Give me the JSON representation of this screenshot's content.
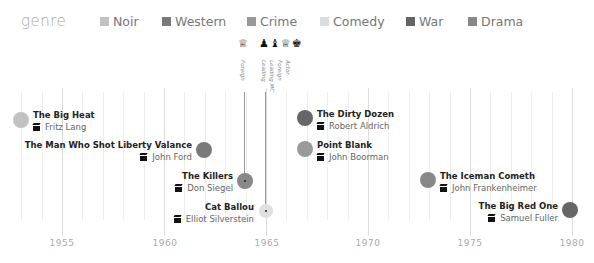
{
  "legend": {
    "title": "genre",
    "items": [
      {
        "label": "Noir",
        "color": "#c2c2c2",
        "x": 100
      },
      {
        "label": "Western",
        "color": "#7a7a7a",
        "x": 162
      },
      {
        "label": "Crime",
        "color": "#999999",
        "x": 247
      },
      {
        "label": "Comedy",
        "color": "#dcdcdc",
        "x": 320
      },
      {
        "label": "War",
        "color": "#636363",
        "x": 406
      },
      {
        "label": "Drama",
        "color": "#888888",
        "x": 468
      }
    ]
  },
  "axis": {
    "ticks": [
      {
        "label": "1955",
        "x": 62
      },
      {
        "label": "1960",
        "x": 165
      },
      {
        "label": "1965",
        "x": 267
      },
      {
        "label": "1970",
        "x": 368
      },
      {
        "label": "1975",
        "x": 470
      },
      {
        "label": "1980",
        "x": 572
      }
    ]
  },
  "awards": {
    "groups": [
      {
        "film": "The Killers",
        "x": 244,
        "labels": [
          "Foreign"
        ],
        "icons": [
          "golden-globe"
        ]
      },
      {
        "film": "Cat Ballou",
        "x": 265,
        "labels": [
          "Leading",
          "Leading MC",
          "Foreign",
          "Actor"
        ],
        "icons": [
          "oscar",
          "chess-piece",
          "golden-globe",
          "bafta"
        ]
      }
    ]
  },
  "chart_data": {
    "type": "scatter",
    "title": "",
    "xlabel": "Year",
    "ylabel": "",
    "xlim": [
      1952.5,
      1981
    ],
    "x_ticks": [
      1955,
      1960,
      1965,
      1970,
      1975,
      1980
    ],
    "legend": {
      "title": "genre",
      "entries": [
        "Noir",
        "Western",
        "Crime",
        "Comedy",
        "War",
        "Drama"
      ],
      "position": "top"
    },
    "points": [
      {
        "title": "The Big Heat",
        "director": "Fritz Lang",
        "year": 1953,
        "genre": "Noir"
      },
      {
        "title": "The Man Who Shot Liberty Valance",
        "director": "John Ford",
        "year": 1962,
        "genre": "Western"
      },
      {
        "title": "The Killers",
        "director": "Don Siegel",
        "year": 1964,
        "genre": "Crime",
        "awards": [
          "Golden Globe - Foreign"
        ]
      },
      {
        "title": "Cat Ballou",
        "director": "Elliot Silverstein",
        "year": 1965,
        "genre": "Comedy",
        "awards": [
          "Oscar - Leading",
          "Leading MC",
          "Golden Globe - Foreign",
          "BAFTA - Actor"
        ]
      },
      {
        "title": "The Dirty Dozen",
        "director": "Robert Aldrich",
        "year": 1967,
        "genre": "War"
      },
      {
        "title": "Point Blank",
        "director": "John Boorman",
        "year": 1967,
        "genre": "Crime"
      },
      {
        "title": "The Iceman Cometh",
        "director": "John Frankenheimer",
        "year": 1973,
        "genre": "Drama"
      },
      {
        "title": "The Big Red One",
        "director": "Samuel Fuller",
        "year": 1980,
        "genre": "War"
      }
    ]
  },
  "films": [
    {
      "title": "The Big Heat",
      "director": "Fritz Lang",
      "cx": 21,
      "cy": 120,
      "r": 8,
      "color": "#c2c2c2",
      "side": "right",
      "lx": 33,
      "ly": 109
    },
    {
      "title": "The Man Who Shot Liberty Valance",
      "director": "John Ford",
      "cx": 204,
      "cy": 150,
      "r": 8,
      "color": "#7a7a7a",
      "side": "left",
      "lx": 10,
      "ly": 139,
      "lw": 182
    },
    {
      "title": "The Killers",
      "director": "Don Siegel",
      "cx": 245,
      "cy": 181,
      "r": 8,
      "color": "#888888",
      "side": "left",
      "lx": 150,
      "ly": 170,
      "lw": 83,
      "dot": true
    },
    {
      "title": "Cat Ballou",
      "director": "Elliot Silverstein",
      "cx": 266,
      "cy": 211,
      "r": 7,
      "color": "#e0e0e0",
      "side": "left",
      "lx": 150,
      "ly": 201,
      "lw": 104,
      "dot": true
    },
    {
      "title": "The Dirty Dozen",
      "director": "Robert Aldrich",
      "cx": 305,
      "cy": 118,
      "r": 8,
      "color": "#666666",
      "side": "right",
      "lx": 317,
      "ly": 108
    },
    {
      "title": "Point Blank",
      "director": "John Boorman",
      "cx": 305,
      "cy": 149,
      "r": 8,
      "color": "#9a9a9a",
      "side": "right",
      "lx": 317,
      "ly": 139
    },
    {
      "title": "The Iceman Cometh",
      "director": "John Frankenheimer",
      "cx": 428,
      "cy": 180,
      "r": 8,
      "color": "#888888",
      "side": "right",
      "lx": 440,
      "ly": 170
    },
    {
      "title": "The Big Red One",
      "director": "Samuel Fuller",
      "cx": 570,
      "cy": 210,
      "r": 8,
      "color": "#666666",
      "side": "left",
      "lx": 450,
      "ly": 200,
      "lw": 108
    }
  ]
}
